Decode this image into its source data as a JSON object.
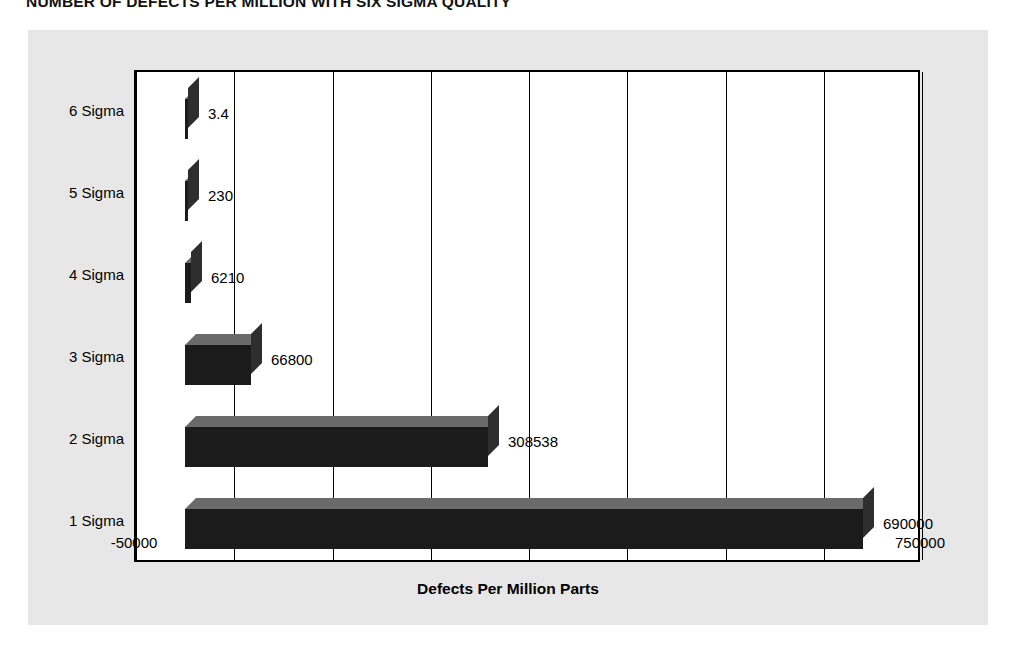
{
  "chart_title": "NUMBER OF DEFECTS PER MILLION WITH SIX SIGMA QUALITY",
  "axis": {
    "x_title": "Defects Per Million Parts"
  },
  "colors": {
    "panel_background": "#e7e7e7",
    "plot_background": "#ffffff",
    "frame": "#000000",
    "bar_front": "#1b1b1b",
    "bar_top": "#6a6a6a",
    "bar_side": "#2e2e2e",
    "text": "#000000"
  },
  "chart_data": {
    "type": "bar",
    "orientation": "horizontal",
    "title": "NUMBER OF DEFECTS PER MILLION WITH SIX SIGMA QUALITY",
    "xlabel": "Defects Per Million Parts",
    "ylabel": "",
    "grid": true,
    "legend": "none",
    "xlim": [
      -50000,
      750000
    ],
    "xticks": [
      -50000,
      50000,
      150000,
      250000,
      350000,
      450000,
      550000,
      650000,
      750000
    ],
    "xtick_labels": [
      "-50000",
      "50000",
      "150000",
      "250000",
      "350000",
      "450000",
      "550000",
      "650000",
      "750000"
    ],
    "categories": [
      "1 Sigma",
      "2 Sigma",
      "3 Sigma",
      "4 Sigma",
      "5 Sigma",
      "6 Sigma"
    ],
    "values": [
      690000,
      308538,
      66800,
      6210,
      230,
      3.4
    ],
    "data_labels": [
      "690000",
      "308538",
      "66800",
      "6210",
      "230",
      "3.4"
    ],
    "series": [
      {
        "name": "Defects Per Million Parts",
        "points": [
          {
            "category": "6 Sigma",
            "value": 3.4,
            "label": "3.4"
          },
          {
            "category": "5 Sigma",
            "value": 230,
            "label": "230"
          },
          {
            "category": "4 Sigma",
            "value": 6210,
            "label": "6210"
          },
          {
            "category": "3 Sigma",
            "value": 66800,
            "label": "66800"
          },
          {
            "category": "2 Sigma",
            "value": 308538,
            "label": "308538"
          },
          {
            "category": "1 Sigma",
            "value": 690000,
            "label": "690000"
          }
        ]
      }
    ]
  }
}
